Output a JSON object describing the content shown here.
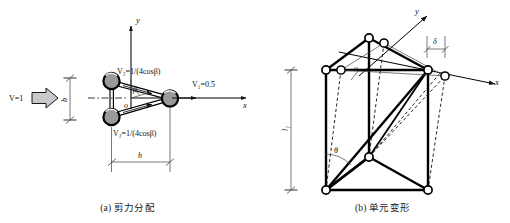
{
  "figure": {
    "panel_a": {
      "caption": "(a) 剪力分配",
      "axis_x_label": "x",
      "axis_y_label": "y",
      "origin_label": "o",
      "angle_label": "β",
      "input_force_label": "V=1",
      "right_node_label": "V₁=0.5",
      "top_node_label": "V₂=1/(4cosβ)",
      "bottom_node_label": "V₂=1/(4cosβ)",
      "dim_vertical_label": "b",
      "dim_horizontal_label": "h",
      "node_count": 3,
      "node_fill": "#9a9a9a",
      "node_stroke": "#000000",
      "arrow_fill": "#c9c9c9"
    },
    "panel_b": {
      "caption": "(b) 单元变形",
      "axis_x_label": "x",
      "axis_y_label": "y",
      "origin_label": "o",
      "angle_label": "θ",
      "offset_label": "δ",
      "height_label": "l₁",
      "node_fill": "#ffffff",
      "node_stroke": "#000000",
      "solid_stroke": "#000000",
      "dashed_stroke": "#111111"
    }
  }
}
